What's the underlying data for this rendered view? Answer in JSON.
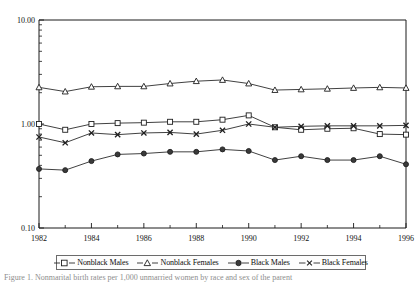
{
  "chart_data": {
    "type": "line",
    "title": "",
    "xlabel": "",
    "ylabel": "",
    "yscale": "log",
    "ylim": [
      0.1,
      10.0
    ],
    "ytick_labels": [
      "10.00",
      "1.00",
      "0.10"
    ],
    "ytick_values": [
      10.0,
      1.0,
      0.1
    ],
    "xlim": [
      1982,
      1996
    ],
    "x": [
      1982,
      1983,
      1984,
      1985,
      1986,
      1987,
      1988,
      1989,
      1990,
      1991,
      1992,
      1993,
      1994,
      1995,
      1996
    ],
    "xtick_labels": [
      "1982",
      "1984",
      "1986",
      "1988",
      "1990",
      "1992",
      "1994",
      "1996"
    ],
    "xtick_values": [
      1982,
      1984,
      1986,
      1988,
      1990,
      1992,
      1994,
      1996
    ],
    "grid": false,
    "legend_position": "bottom",
    "series": [
      {
        "name": "Nonblack Males",
        "marker": "open-square",
        "values": [
          1.0,
          0.88,
          1.0,
          1.02,
          1.03,
          1.05,
          1.05,
          1.1,
          1.21,
          0.93,
          0.88,
          0.9,
          0.91,
          0.8,
          0.79
        ]
      },
      {
        "name": "Nonblack Females",
        "marker": "open-triangle",
        "values": [
          2.25,
          2.05,
          2.28,
          2.3,
          2.3,
          2.45,
          2.58,
          2.65,
          2.45,
          2.12,
          2.15,
          2.18,
          2.22,
          2.25,
          2.22
        ]
      },
      {
        "name": "Black Males",
        "marker": "filled-circle",
        "values": [
          0.37,
          0.36,
          0.44,
          0.51,
          0.52,
          0.54,
          0.54,
          0.57,
          0.55,
          0.45,
          0.49,
          0.45,
          0.45,
          0.49,
          0.41
        ]
      },
      {
        "name": "Black Females",
        "marker": "cross-x",
        "values": [
          0.75,
          0.66,
          0.82,
          0.79,
          0.82,
          0.83,
          0.8,
          0.87,
          1.0,
          0.93,
          0.95,
          0.96,
          0.96,
          0.96,
          0.97
        ]
      }
    ]
  },
  "legend": {
    "entries": [
      {
        "label": "Nonblack Males",
        "marker": "open-square"
      },
      {
        "label": "Nonblack Females",
        "marker": "open-triangle"
      },
      {
        "label": "Black Males",
        "marker": "filled-circle"
      },
      {
        "label": "Black Females",
        "marker": "cross-x"
      }
    ]
  },
  "caption": {
    "text": "Figure 1. Nonmarital birth rates per 1,000 unmarried women by race and sex of the parent"
  },
  "colors": {
    "line": "#2b2b2b",
    "marker_stroke": "#1f1f1f",
    "marker_fill_open": "#ffffff",
    "marker_fill_solid": "#3a3a3a",
    "axis": "#1a1a1a",
    "background": "#ffffff"
  }
}
